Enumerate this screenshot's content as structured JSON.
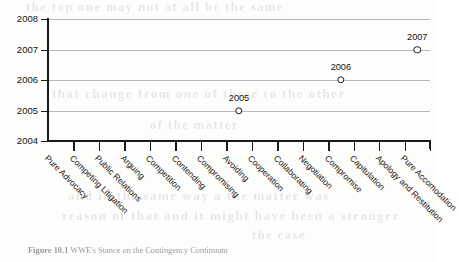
{
  "figure": {
    "caption_number": "Figure 10.1",
    "caption_text": "WWE's Stance on the Contingency Continuum"
  },
  "bleed_through": {
    "line_top": "the  top  one  may  not  at  all  be  the  same",
    "line_mid": "that  change  from  one  of  these  to  the  other",
    "line_low": "of  the  matter",
    "line_bot1": "and  in  the  same  way  a  the  matter  was",
    "line_bot2": "reason  of  that  and  it  might  have  been  a  stronger",
    "line_bot3": "the  case"
  },
  "chart_data": {
    "type": "scatter",
    "title": "",
    "xlabel": "",
    "ylabel": "",
    "ylim": [
      2004,
      2008
    ],
    "yticks": [
      2004,
      2005,
      2006,
      2007,
      2008
    ],
    "ytick_labels": [
      "2004",
      "2005",
      "2006",
      "2007",
      "2008"
    ],
    "grid": true,
    "legend": false,
    "categories": [
      "Pure Advocacy",
      "Competing Litigation",
      "Public Relations",
      "Arguing",
      "Competition",
      "Contending",
      "Compromising",
      "Avoiding",
      "Cooperation",
      "Collaborating",
      "Negotiation",
      "Compromise",
      "Capitulation",
      "Apology and Restitution",
      "Pure Accomodation"
    ],
    "points": [
      {
        "category": "Avoiding",
        "category_index": 7,
        "value": 2005,
        "label": "2005"
      },
      {
        "category": "Compromise",
        "category_index": 11,
        "value": 2006,
        "label": "2006"
      },
      {
        "category": "Pure Accomodation",
        "category_index": 14,
        "value": 2007,
        "label": "2007"
      }
    ],
    "marker_style": "open-circle",
    "marker_color": "#1d1d1d"
  }
}
